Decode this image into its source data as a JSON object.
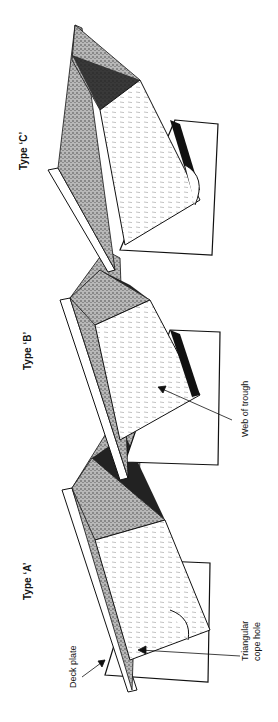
{
  "figure": {
    "orientation": "rotated-90-ccw",
    "types": [
      {
        "label": "Type ‘A’"
      },
      {
        "label": "Type ‘B’"
      },
      {
        "label": "Type ‘C’"
      }
    ],
    "annotations": {
      "deck_plate": "Deck plate",
      "cope_hole_line1": "Triangular",
      "cope_hole_line2": "cope hole",
      "web_of_trough": "Web of trough"
    },
    "colors": {
      "ink": "#111111",
      "stipple": "#8a8a8a",
      "paper": "#ffffff"
    }
  }
}
